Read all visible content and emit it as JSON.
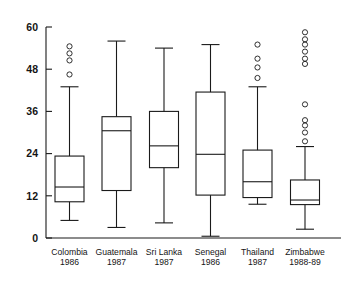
{
  "chart_data": {
    "type": "box",
    "title": "",
    "xlabel": "",
    "ylabel": "",
    "ylim": [
      0,
      60
    ],
    "yticks": [
      0,
      12,
      24,
      36,
      48,
      60
    ],
    "ytick_labels": [
      "0",
      "12",
      "24",
      "36",
      "48",
      "60"
    ],
    "grid": false,
    "legend": "none",
    "categories": [
      "Colombia\n1986",
      "Guatemala\n1987",
      "Sri Lanka\n1987",
      "Senegal\n1986",
      "Thailand\n1987",
      "Zimbabwe\n1988-89"
    ],
    "boxes": [
      {
        "name": "Colombia",
        "year": "1986",
        "label_line1": "Colombia",
        "label_line2": "1986",
        "whisker_low": 5.0,
        "q1": 10.3,
        "median": 14.5,
        "q3": 23.3,
        "whisker_high": 43.0,
        "outliers": [
          46.5,
          50.5,
          52.5,
          54.5
        ]
      },
      {
        "name": "Guatemala",
        "year": "1987",
        "label_line1": "Guatemala",
        "label_line2": "1987",
        "whisker_low": 3.0,
        "q1": 13.5,
        "median": 30.5,
        "q3": 34.5,
        "whisker_high": 56.0,
        "outliers": []
      },
      {
        "name": "Sri Lanka",
        "year": "1987",
        "label_line1": "Sri Lanka",
        "label_line2": "1987",
        "whisker_low": 4.3,
        "q1": 20.0,
        "median": 26.2,
        "q3": 36.0,
        "whisker_high": 54.0,
        "outliers": []
      },
      {
        "name": "Senegal",
        "year": "1986",
        "label_line1": "Senegal",
        "label_line2": "1986",
        "whisker_low": 0.5,
        "q1": 12.2,
        "median": 23.8,
        "q3": 41.5,
        "whisker_high": 55.0,
        "outliers": []
      },
      {
        "name": "Thailand",
        "year": "1987",
        "label_line1": "Thailand",
        "label_line2": "1987",
        "whisker_low": 9.6,
        "q1": 11.5,
        "median": 16.0,
        "q3": 25.0,
        "whisker_high": 43.0,
        "outliers": [
          45.5,
          48.5,
          51.0,
          55.0
        ]
      },
      {
        "name": "Zimbabwe",
        "year": "1988-89",
        "label_line1": "Zimbabwe",
        "label_line2": "1988-89",
        "whisker_low": 2.5,
        "q1": 9.5,
        "median": 10.8,
        "q3": 16.5,
        "whisker_high": 26.0,
        "outliers": [
          27.5,
          30.0,
          32.0,
          33.5,
          38.0,
          49.5,
          51.0,
          53.0,
          55.0,
          56.5,
          58.5
        ]
      }
    ]
  }
}
